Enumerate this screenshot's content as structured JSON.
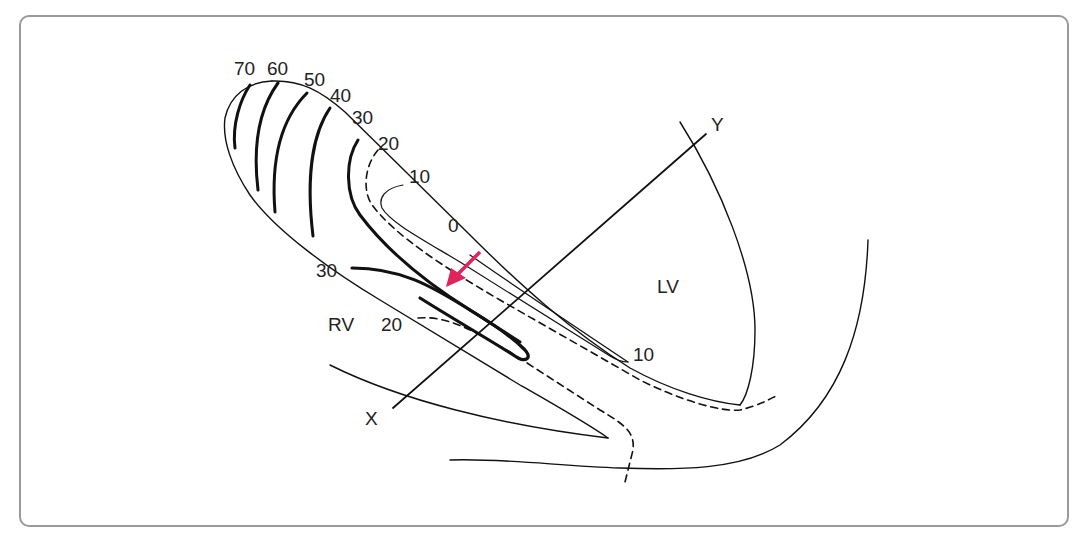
{
  "diagram": {
    "type": "cardiac-septum-isobar-diagram",
    "colors": {
      "frame": "#9a9a9a",
      "ink": "#111111",
      "arrow": "#e0245e"
    },
    "top_contour_labels": [
      "70",
      "60",
      "50",
      "40",
      "30",
      "20",
      "10",
      "0"
    ],
    "rv_side_labels": [
      "30",
      "20"
    ],
    "lv_side_labels": [
      "10"
    ],
    "chambers": {
      "left_ventricle": "LV",
      "right_ventricle": "RV"
    },
    "axes": {
      "x": "X",
      "y": "Y"
    }
  }
}
